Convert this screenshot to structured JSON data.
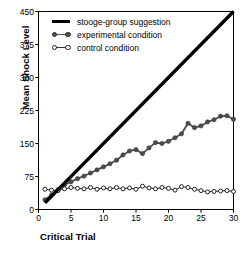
{
  "chart_data": {
    "type": "line",
    "title": "",
    "xlabel": "Critical Trial",
    "ylabel": "Mean Shock Level",
    "xlim": [
      0,
      30
    ],
    "ylim": [
      0,
      450
    ],
    "xticks": [
      0,
      5,
      10,
      15,
      20,
      25,
      30
    ],
    "yticks": [
      0,
      75,
      150,
      225,
      300,
      375,
      450
    ],
    "grid": false,
    "legend_position": "top-left",
    "x": [
      1,
      2,
      3,
      4,
      5,
      6,
      7,
      8,
      9,
      10,
      11,
      12,
      13,
      14,
      15,
      16,
      17,
      18,
      19,
      20,
      21,
      22,
      23,
      24,
      25,
      26,
      27,
      28,
      29,
      30
    ],
    "series": [
      {
        "name": "stooge-group suggestion",
        "style": "thick-solid-line",
        "color": "#000000",
        "marker": "none",
        "values": [
          15,
          30,
          45,
          60,
          75,
          90,
          105,
          120,
          135,
          150,
          165,
          180,
          195,
          210,
          225,
          240,
          255,
          270,
          285,
          300,
          315,
          330,
          345,
          360,
          375,
          390,
          405,
          420,
          435,
          450
        ]
      },
      {
        "name": "experimental condition",
        "style": "line-with-filled-circles",
        "color": "#4d4d4d",
        "marker": "filled-circle",
        "values": [
          22,
          33,
          45,
          56,
          63,
          70,
          76,
          83,
          90,
          97,
          104,
          112,
          124,
          133,
          136,
          127,
          140,
          152,
          150,
          155,
          163,
          172,
          196,
          186,
          190,
          199,
          204,
          212,
          213,
          205
        ]
      },
      {
        "name": "control condition",
        "style": "line-with-open-circles",
        "color": "#222222",
        "marker": "open-circle",
        "values": [
          46,
          44,
          43,
          47,
          50,
          48,
          47,
          50,
          46,
          49,
          47,
          50,
          47,
          49,
          46,
          53,
          49,
          47,
          50,
          48,
          44,
          52,
          50,
          46,
          43,
          40,
          41,
          42,
          43,
          41
        ]
      }
    ]
  },
  "legend": {
    "items": [
      {
        "label": "stooge-group suggestion"
      },
      {
        "label": "experimental condition"
      },
      {
        "label": "control condition"
      }
    ]
  },
  "axes": {
    "y_title": "Mean Shock Level",
    "x_title": "Critical Trial",
    "y_tick_labels": [
      "450",
      "375",
      "300",
      "225",
      "150",
      "75",
      "0"
    ],
    "x_tick_labels": [
      "0",
      "5",
      "10",
      "15",
      "20",
      "25",
      "30"
    ]
  },
  "colors": {
    "stooge": "#000000",
    "experimental": "#4d4d4d",
    "control": "#222222",
    "axis": "#000000",
    "background": "#ffffff"
  }
}
